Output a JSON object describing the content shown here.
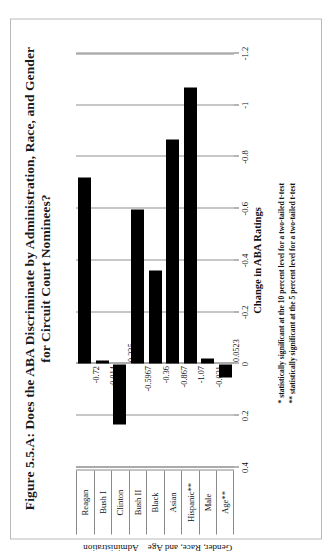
{
  "figure": {
    "title_line1": "Figure 5.5.A: Does the ABA Discriminate by Administration, Race, and Gender",
    "title_line2": "for Circuit Court Nominees?"
  },
  "footnotes": {
    "line1": "* statistically significant at the 10 percent level for a two-tailed t-test",
    "line2": "** statistically significant at the 5 percent level for a two-tailed t-test"
  },
  "axes": {
    "value_axis_title": "Change in ABA Ratings",
    "group_label_left": "Administration",
    "group_label_right": "Gender, Race, and Age"
  },
  "chart_data": {
    "type": "bar",
    "orientation": "horizontal",
    "title": "Figure 5.5.A: Does the ABA Discriminate by Administration, Race, and Gender for Circuit Court Nominees?",
    "xlabel": "Change in ABA Ratings",
    "ylabel": "",
    "xlim": [
      0.4,
      -1.2
    ],
    "axis_direction": "decreasing",
    "grid": true,
    "legend": "none",
    "tick_labels": [
      "0.4",
      "0.2",
      "0",
      "-0.2",
      "-0.4",
      "-0.6",
      "-0.8",
      "-1",
      "-1.2"
    ],
    "tick_values": [
      0.4,
      0.2,
      0,
      -0.2,
      -0.4,
      -0.6,
      -0.8,
      -1,
      -1.2
    ],
    "categories": [
      "Reagan",
      "Bush I",
      "Clinton",
      "Bush II",
      "Black",
      "Asian",
      "Hispanic**",
      "Male",
      "Age**"
    ],
    "values": [
      -0.72,
      -0.014,
      0.235,
      -0.5967,
      -0.36,
      -0.867,
      -1.07,
      -0.021,
      0.0523
    ],
    "data_labels": [
      "-0.72",
      "-0.014",
      "0.235",
      "-0.5967",
      "-0.36",
      "-0.867",
      "-1.07",
      "-0.021",
      "0.0523"
    ],
    "groups": [
      {
        "label": "Administration",
        "categories": [
          "Reagan",
          "Bush I",
          "Clinton",
          "Bush II"
        ]
      },
      {
        "label": "Gender, Race, and Age",
        "categories": [
          "Black",
          "Asian",
          "Hispanic**",
          "Male",
          "Age**"
        ]
      }
    ],
    "bar_color": "#000000",
    "annotations": [
      "* statistically significant at the 10 percent level for a two-tailed t-test",
      "** statistically significant at the 5 percent level for a two-tailed t-test"
    ]
  }
}
